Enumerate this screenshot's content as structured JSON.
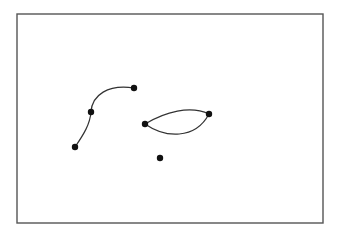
{
  "diagram": {
    "frame": {
      "x": 17,
      "y": 14,
      "width": 306,
      "height": 209,
      "stroke": "#555555",
      "stroke_width": 1.4
    },
    "colors": {
      "line": "#333333",
      "point": "#111111",
      "background": "#ffffff"
    },
    "point_radius": 3.2,
    "points": [
      {
        "id": "p1",
        "x": 75,
        "y": 147
      },
      {
        "id": "p2",
        "x": 91,
        "y": 112
      },
      {
        "id": "p3",
        "x": 134,
        "y": 88
      },
      {
        "id": "p4",
        "x": 145,
        "y": 124
      },
      {
        "id": "p5",
        "x": 209,
        "y": 114
      },
      {
        "id": "p6",
        "x": 160,
        "y": 158
      }
    ],
    "curves": [
      {
        "id": "open-curve-lower",
        "d": "M75,147 C84,134 90,124 91,112"
      },
      {
        "id": "open-curve-upper",
        "d": "M91,112 C92,95 108,84 134,88"
      },
      {
        "id": "lens-upper-arc",
        "d": "M145,124 C165,112 190,105 209,114"
      },
      {
        "id": "lens-lower-arc",
        "d": "M145,124 C165,138 195,140 209,114"
      }
    ]
  }
}
